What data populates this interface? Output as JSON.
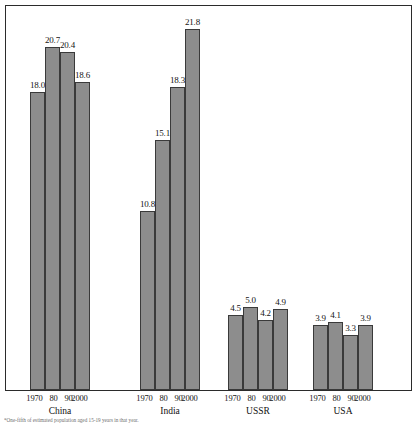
{
  "chart_data": {
    "type": "bar",
    "title": "",
    "subtitle": "",
    "xlabel": "",
    "ylabel": "",
    "ylim": [
      0,
      21.8
    ],
    "grid": false,
    "legend_position": "none",
    "groups": [
      "China",
      "India",
      "USSR",
      "USA"
    ],
    "categories": [
      "1970",
      "80",
      "90",
      "2000"
    ],
    "series": [
      {
        "name": "China",
        "values": [
          18.0,
          20.7,
          20.4,
          18.6
        ],
        "labels": [
          "18.0",
          "20.7",
          "20.4",
          "18.6"
        ]
      },
      {
        "name": "India",
        "values": [
          10.8,
          15.1,
          18.3,
          21.8
        ],
        "labels": [
          "10.8",
          "15.1",
          "18.3",
          "21.8"
        ]
      },
      {
        "name": "USSR",
        "values": [
          4.5,
          5.0,
          4.2,
          4.9
        ],
        "labels": [
          "4.5",
          "5.0",
          "4.2",
          "4.9"
        ]
      },
      {
        "name": "USA",
        "values": [
          3.9,
          4.1,
          3.3,
          3.9
        ],
        "labels": [
          "3.9",
          "4.1",
          "3.3",
          "3.9"
        ]
      }
    ],
    "bar_color": "#8d8d8d",
    "bar_outline_color": "#3a3a3a",
    "frame_color": "#2b2b2b"
  },
  "axis": {
    "tick_labels": [
      "1970",
      "80",
      "90",
      "2000"
    ],
    "group_labels": [
      "China",
      "India",
      "USSR",
      "USA"
    ]
  },
  "footnote": {
    "text": "*One-fifth of estimated population aged 15-19 years in that year."
  }
}
